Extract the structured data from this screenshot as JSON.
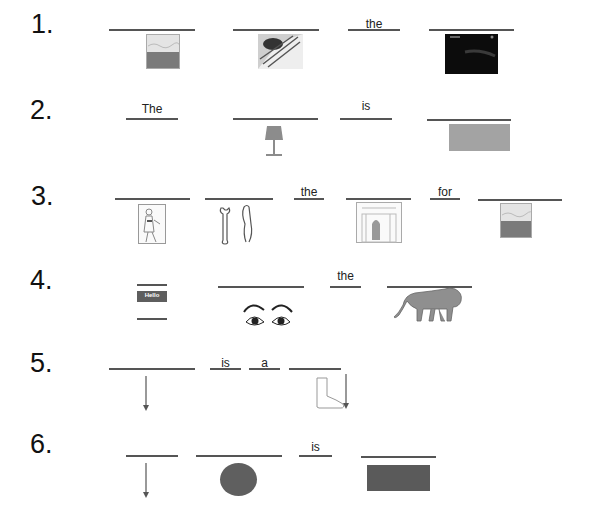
{
  "worksheet": {
    "rows": [
      {
        "number": "1.",
        "words": [
          "",
          "",
          "the",
          ""
        ],
        "pictures": [
          "beach-photo",
          "hands-sewing-photo",
          "night-scene-photo"
        ]
      },
      {
        "number": "2.",
        "words": [
          "The",
          "",
          "is",
          ""
        ],
        "pictures": [
          "lamp",
          "gray-rectangle"
        ]
      },
      {
        "number": "3.",
        "words": [
          "",
          "",
          "the",
          "",
          "for",
          ""
        ],
        "pictures": [
          "person-drawing",
          "wrench-and-pliers",
          "building-door-drawing",
          "beach-photo"
        ]
      },
      {
        "number": "4.",
        "words": [
          "",
          "",
          "the",
          ""
        ],
        "pictures": [
          "hello-name-tag",
          "eyes",
          "lion"
        ],
        "name_tag_text": "Hello"
      },
      {
        "number": "5.",
        "words": [
          "",
          "is",
          "a",
          ""
        ],
        "pictures": [
          "down-arrow",
          "foot-with-arrow"
        ]
      },
      {
        "number": "6.",
        "words": [
          "",
          "",
          "is",
          ""
        ],
        "pictures": [
          "down-arrow",
          "dark-gray-circle",
          "dark-gray-rectangle"
        ]
      }
    ]
  }
}
